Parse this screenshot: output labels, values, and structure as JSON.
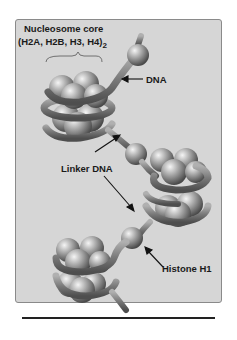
{
  "figure": {
    "title_line1": "Nucleosome core",
    "title_line2": "(H2A, H2B, H3, H4)",
    "title_subscript": "2",
    "labels": {
      "dna": "DNA",
      "linker_dna": "Linker DNA",
      "histone_h1": "Histone H1"
    },
    "colors": {
      "panel_bg": "#d6d6d6",
      "panel_border": "#8a8a8a",
      "sphere_light": "#f2f2f2",
      "sphere_dark": "#5a5a5a",
      "dna_strand": "#7a7a7a",
      "text": "#1a1a1a"
    }
  }
}
